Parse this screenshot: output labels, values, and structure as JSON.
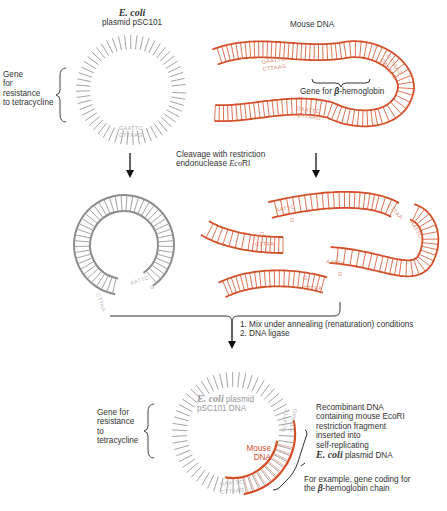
{
  "colors": {
    "plasmid": "#8c8c8c",
    "mouse_dna": "#d4502a",
    "text": "#333333",
    "arrow": "#111111"
  },
  "top": {
    "plasmid_title_italic": "E. coli",
    "plasmid_title": "plasmid pSC101",
    "mouse_title": "Mouse DNA",
    "tet_gene_label": [
      "Gene",
      "for",
      "resistance",
      "to tetracycline"
    ],
    "beta_gene_label_prefix": "Gene for ",
    "beta_symbol": "β",
    "beta_gene_label_suffix": "-hemoglobin",
    "site_top": "GAATTC",
    "site_bottom": "CTTAAG"
  },
  "step1": {
    "line1": "Cleavage with restriction",
    "line2_prefix": "endonuclease ",
    "line2_enzyme_italic": "Eco",
    "line2_enzyme_suffix": "RI"
  },
  "middle": {
    "sticky_end_a": "AATTC",
    "sticky_end_b": "G",
    "sticky_end_c": "CTTAA"
  },
  "step2": {
    "item1": "1.  Mix under annealing (renaturation) conditions",
    "item2": "2.  DNA ligase"
  },
  "bottom": {
    "tet_gene_label": [
      "Gene for",
      "resistance",
      "to",
      "tetracycline"
    ],
    "plasmid_inner_italic": "E. coli",
    "plasmid_inner_1": " plasmid",
    "plasmid_inner_2": "pSC101 DNA",
    "mouse_inner_1": "Mouse",
    "mouse_inner_2": "DNA",
    "recombinant_lines": [
      "Recombinant DNA",
      "containing mouse EcoRI",
      "restriction fragment",
      "inserted into",
      "self-replicating"
    ],
    "recombinant_italic": "E. coli",
    "recombinant_last": " plasmid DNA",
    "example_line1": "For example, gene coding for",
    "example_line2_prefix": "the ",
    "example_beta": "β",
    "example_line2_suffix": "-hemoglobin chain"
  }
}
